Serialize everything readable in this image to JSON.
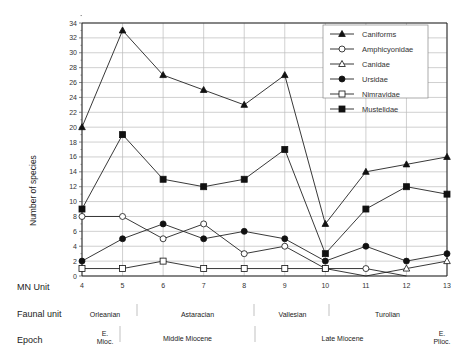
{
  "chart_data": {
    "type": "line",
    "title": "",
    "xlabel": "MN Unit",
    "ylabel": "Number of species",
    "ylim": [
      0,
      34
    ],
    "yticks": [
      0,
      2,
      4,
      6,
      8,
      10,
      12,
      14,
      16,
      18,
      20,
      22,
      24,
      26,
      28,
      30,
      32,
      34
    ],
    "x": [
      4,
      5,
      6,
      7,
      8,
      9,
      10,
      11,
      12,
      13
    ],
    "grid": true,
    "legend_position": "upper right",
    "series": [
      {
        "name": "Caniforms",
        "marker": "filled-triangle",
        "values": [
          20,
          33,
          27,
          25,
          23,
          27,
          7,
          14,
          15,
          16
        ]
      },
      {
        "name": "Amphicyonidae",
        "marker": "open-circle",
        "values": [
          8,
          8,
          5,
          7,
          3,
          4,
          1,
          1,
          0,
          null
        ]
      },
      {
        "name": "Canidae",
        "marker": "open-triangle",
        "values": [
          null,
          null,
          null,
          null,
          null,
          null,
          1,
          0,
          1,
          2
        ]
      },
      {
        "name": "Ursidae",
        "marker": "filled-circle",
        "values": [
          2,
          5,
          7,
          5,
          6,
          5,
          2,
          4,
          2,
          3
        ]
      },
      {
        "name": "Nimravidae",
        "marker": "open-square",
        "values": [
          1,
          1,
          2,
          1,
          1,
          1,
          1,
          null,
          null,
          null
        ]
      },
      {
        "name": "Mustelidae",
        "marker": "filled-square",
        "values": [
          9,
          19,
          13,
          12,
          13,
          17,
          3,
          9,
          12,
          11
        ]
      }
    ]
  },
  "rows": {
    "mn_label": "MN Unit",
    "faunal_label": "Faunal unit",
    "epoch_label": "Epoch"
  },
  "faunal_units": [
    "Orleanian",
    "Astaracian",
    "Vallesian",
    "Turolian"
  ],
  "epochs": {
    "e_mioc_1": "E.",
    "e_mioc_2": "Mioc.",
    "middle": "Middle Miocene",
    "late": "Late Miocene",
    "e_plioc_1": "E.",
    "e_plioc_2": "Plioc."
  }
}
